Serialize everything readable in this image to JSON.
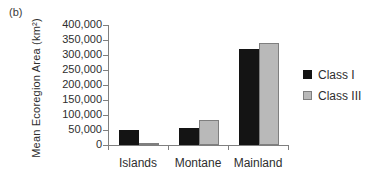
{
  "figure": {
    "panel_label": "(b)",
    "background": "#ffffff",
    "axis_color": "#7f7f7f",
    "text_color": "#2e2e2e"
  },
  "chart_data": {
    "type": "bar",
    "title": "",
    "xlabel": "",
    "ylabel": "Mean Ecoregion Area (km²)",
    "categories": [
      "Islands",
      "Montane",
      "Mainland"
    ],
    "series": [
      {
        "name": "Class I",
        "color": "#141414",
        "border": "#141414",
        "values": [
          50000,
          55000,
          320000
        ]
      },
      {
        "name": "Class III",
        "color": "#b9b9b9",
        "border": "#7f7f7f",
        "values": [
          5000,
          82000,
          340000
        ]
      }
    ],
    "ylim": [
      0,
      400000
    ],
    "ytick_step": 50000,
    "ytick_labels": [
      "0",
      "50,000",
      "100,000",
      "150,000",
      "200,000",
      "250,000",
      "300,000",
      "350,000",
      "400,000"
    ],
    "grid": false,
    "legend_position": "right-middle"
  }
}
